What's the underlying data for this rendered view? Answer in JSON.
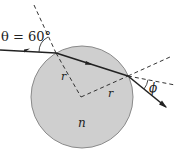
{
  "diagram": {
    "labels": {
      "theta": "θ = 60°",
      "r_left": "r",
      "r_right": "r",
      "phi": "ϕ",
      "n": "n"
    },
    "colors": {
      "sphere_fill": "#cfcfcf",
      "sphere_stroke": "#8a8a8a",
      "ray": "#222222",
      "dashed": "#333333"
    }
  }
}
